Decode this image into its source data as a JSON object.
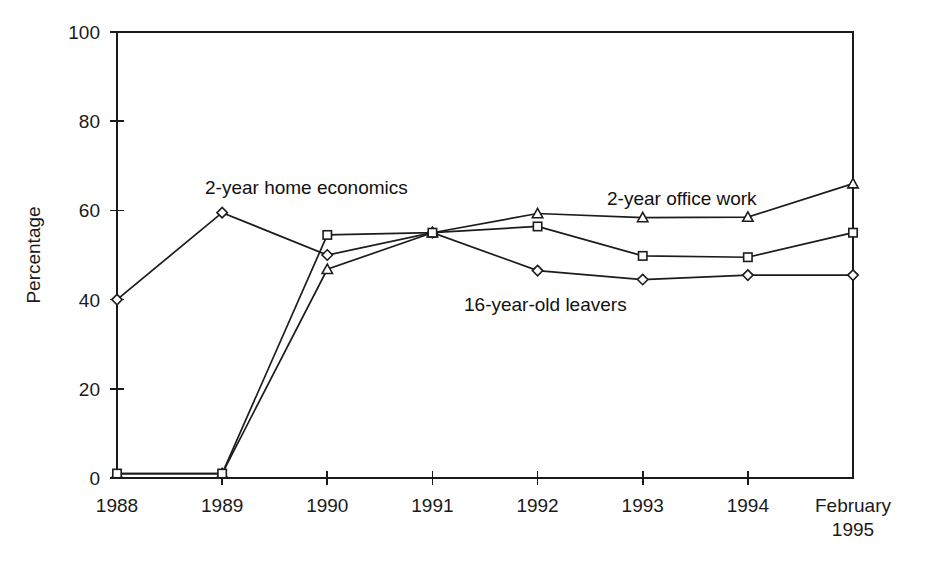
{
  "chart_data": {
    "type": "line",
    "title": "",
    "xlabel": "",
    "ylabel": "Percentage",
    "ylim": [
      0,
      100
    ],
    "yticks": [
      0,
      20,
      40,
      60,
      80,
      100
    ],
    "grid": false,
    "legend_position": "inline-annotations",
    "categories": [
      "1988",
      "1989",
      "1990",
      "1991",
      "1992",
      "1993",
      "1994",
      "February 1995"
    ],
    "category_lines": [
      [
        "1988"
      ],
      [
        "1989"
      ],
      [
        "1990"
      ],
      [
        "1991"
      ],
      [
        "1992"
      ],
      [
        "1993"
      ],
      [
        "1994"
      ],
      [
        "February",
        "1995"
      ]
    ],
    "series": [
      {
        "name": "2-year home economics",
        "marker": "diamond",
        "values": [
          40,
          59.5,
          50,
          55,
          46.5,
          44.5,
          45.5,
          45.5
        ]
      },
      {
        "name": "2-year office work",
        "marker": "triangle",
        "values": [
          1,
          1,
          46.8,
          55,
          59.3,
          58.4,
          58.5,
          66
        ]
      },
      {
        "name": "16-year-old leavers",
        "marker": "square",
        "values": [
          1,
          1,
          54.5,
          55,
          56.4,
          49.8,
          49.5,
          55
        ]
      }
    ],
    "annotations": [
      {
        "text": "2-year home economics",
        "name": "annotation-home-economics",
        "x": 205,
        "y": 194
      },
      {
        "text": "2-year office work",
        "name": "annotation-office-work",
        "x": 607,
        "y": 205
      },
      {
        "text": "16-year-old leavers",
        "name": "annotation-16-year-old-leavers",
        "x": 464,
        "y": 311
      }
    ],
    "colors": {
      "line": "#1c1c1c",
      "axis": "#1a1a1a",
      "marker_fill": "#ffffff",
      "background": "#ffffff"
    }
  }
}
